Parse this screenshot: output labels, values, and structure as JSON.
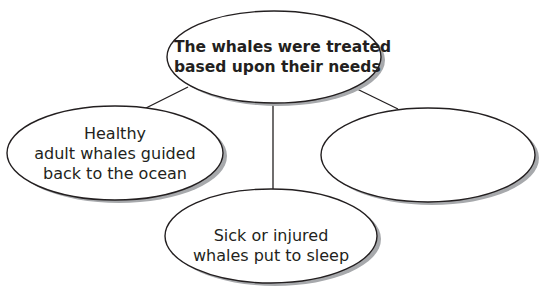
{
  "diagram": {
    "type": "web-organizer",
    "colors": {
      "stroke": "#231f20",
      "shadow": "#a7a9ac",
      "fill": "#ffffff",
      "text": "#231f20"
    },
    "central_node": {
      "lines": [
        "The whales were treated",
        "based upon their needs"
      ]
    },
    "child_nodes": [
      {
        "position": "left",
        "lines": [
          "Healthy",
          "adult whales guided",
          "back to the ocean"
        ]
      },
      {
        "position": "bottom",
        "lines": [
          "Sick or injured",
          "whales put to sleep"
        ]
      },
      {
        "position": "right",
        "lines": []
      }
    ]
  }
}
